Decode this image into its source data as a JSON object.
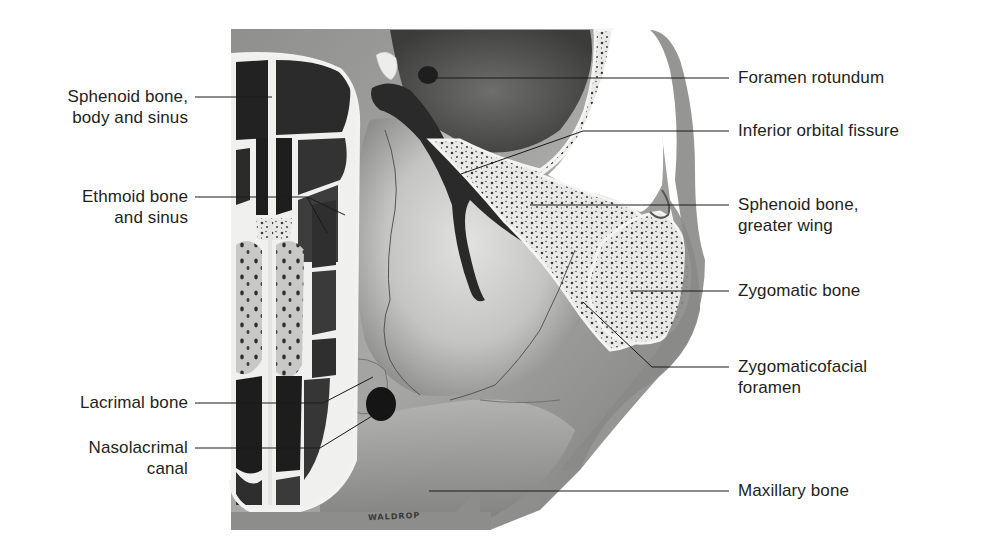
{
  "figure": {
    "artist_signature": "WALDROP",
    "colors": {
      "background": "#ffffff",
      "bone_light": "#e8e8e6",
      "bone_mid": "#9a9a98",
      "bone_dark": "#4a4a48",
      "sinus_dark": "#262626",
      "leader_line": "#1a1a1a",
      "text": "#231f20"
    }
  },
  "labels_left": [
    {
      "id": "sphenoid-body",
      "lines": [
        "Sphenoid bone,",
        "body and sinus"
      ]
    },
    {
      "id": "ethmoid",
      "lines": [
        "Ethmoid bone",
        "and sinus"
      ]
    },
    {
      "id": "lacrimal",
      "lines": [
        "Lacrimal bone"
      ]
    },
    {
      "id": "nasolacrimal",
      "lines": [
        "Nasolacrimal",
        "canal"
      ]
    }
  ],
  "labels_right": [
    {
      "id": "foramen-rotundum",
      "lines": [
        "Foramen rotundum"
      ]
    },
    {
      "id": "inferior-orbital-fissure",
      "lines": [
        "Inferior orbital fissure"
      ]
    },
    {
      "id": "sphenoid-greater-wing",
      "lines": [
        "Sphenoid bone,",
        "greater wing"
      ]
    },
    {
      "id": "zygomatic",
      "lines": [
        "Zygomatic bone"
      ]
    },
    {
      "id": "zygomaticofacial",
      "lines": [
        "Zygomaticofacial",
        "foramen"
      ]
    },
    {
      "id": "maxillary",
      "lines": [
        "Maxillary bone"
      ]
    }
  ]
}
